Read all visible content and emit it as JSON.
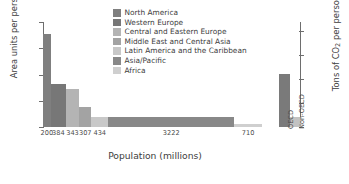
{
  "chart_data": {
    "type": "bar",
    "title": "",
    "subtitle": "",
    "xlabel": "Population (millions)",
    "ylabel": "Area units per person",
    "ylabel_right": "Tons of CO2 per person per year",
    "ylim": [
      0,
      8
    ],
    "ylim_right": [
      0,
      21.8
    ],
    "grid": false,
    "legend_position": "top-center",
    "note": "Variable-width bar chart: bar width is proportional to population (millions), bar height is per-capita CO2 emissions.",
    "yticks": [
      "0",
      "2",
      "4",
      "6",
      "8"
    ],
    "ytick_values": [
      0,
      2,
      4,
      6,
      8
    ],
    "yticks_right": [
      "0",
      "5",
      "10",
      "15",
      "20"
    ],
    "ytick_right_values": [
      0,
      5,
      10,
      15,
      20
    ],
    "categories": [
      "North America",
      "Western Europe",
      "Central and Eastern Europe",
      "Middle East and Central Asia",
      "Latin America and the Caribbean",
      "Asia/Pacific",
      "Africa",
      "OECD",
      "Non-OECD"
    ],
    "xtick_labels": [
      "200",
      "384",
      "343",
      "307",
      "434",
      "3222",
      "710",
      "OECD",
      "Non-OECD"
    ],
    "widths_population_millions": [
      200,
      384,
      343,
      307,
      434,
      3222,
      710,
      0,
      0
    ],
    "values_area_units_per_person": [
      7.05,
      3.3,
      2.9,
      1.55,
      0.75,
      0.78,
      0.22,
      4.05,
      0.75
    ],
    "values_tons_co2_per_person_per_year": [
      19.2,
      9.0,
      7.9,
      4.2,
      2.05,
      2.13,
      0.6,
      11.05,
      2.05
    ],
    "series": [
      {
        "name": "Area units per person",
        "values": [
          7.05,
          3.3,
          2.9,
          1.55,
          0.75,
          0.78,
          0.22,
          4.05,
          0.75
        ]
      }
    ],
    "bars": [
      {
        "label": "North America",
        "xtick": "200",
        "population": 200,
        "value": 7.05,
        "co2": 19.2,
        "color": "#7f7f7f"
      },
      {
        "label": "Western Europe",
        "xtick": "384",
        "population": 384,
        "value": 3.3,
        "co2": 9.0,
        "color": "#777777"
      },
      {
        "label": "Central and Eastern Europe",
        "xtick": "343",
        "population": 343,
        "value": 2.9,
        "co2": 7.9,
        "color": "#b4b4b4"
      },
      {
        "label": "Middle East and Central Asia",
        "xtick": "307",
        "population": 307,
        "value": 1.55,
        "co2": 4.2,
        "color": "#a3a3a3"
      },
      {
        "label": "Latin America and the Caribbean",
        "xtick": "434",
        "population": 434,
        "value": 0.75,
        "co2": 2.05,
        "color": "#c8c8c8"
      },
      {
        "label": "Asia/Pacific",
        "xtick": "3222",
        "population": 3222,
        "value": 0.78,
        "co2": 2.13,
        "color": "#888888"
      },
      {
        "label": "Africa",
        "xtick": "710",
        "population": 710,
        "value": 0.22,
        "co2": 0.6,
        "color": "#cfcfcf"
      },
      {
        "label": "OECD",
        "xtick": "OECD",
        "population": 0,
        "value": 4.05,
        "co2": 11.05,
        "color": "#7a7a7a"
      },
      {
        "label": "Non-OECD",
        "xtick": "Non-OECD",
        "population": 0,
        "value": 0.75,
        "co2": 2.05,
        "color": "#c2c2c2"
      }
    ],
    "legend": [
      {
        "label": "North America",
        "color": "#7f7f7f"
      },
      {
        "label": "Western Europe",
        "color": "#777777"
      },
      {
        "label": "Central and Eastern Europe",
        "color": "#b4b4b4"
      },
      {
        "label": "Middle East and Central Asia",
        "color": "#a3a3a3"
      },
      {
        "label": "Latin America and the Caribbean",
        "color": "#c8c8c8"
      },
      {
        "label": "Asia/Pacific",
        "color": "#888888"
      },
      {
        "label": "Africa",
        "color": "#cfcfcf"
      }
    ]
  },
  "axis_right_title_parts": {
    "pre": "Tons of CO",
    "sub": "2",
    "post": " per person per year"
  },
  "colors": {
    "axis": "#6e6e6e",
    "text": "#3d3d3d",
    "tick_text": "#5a5a5a",
    "background": "#ffffff"
  }
}
